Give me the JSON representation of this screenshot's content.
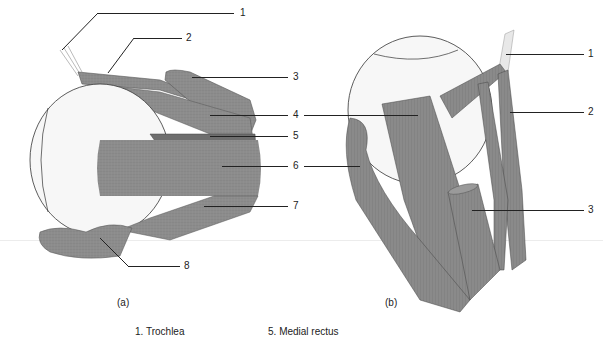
{
  "figure": {
    "panels": [
      {
        "id": "a",
        "caption": "(a)",
        "callouts": [
          "1",
          "2",
          "3",
          "4",
          "5",
          "6",
          "7",
          "8"
        ]
      },
      {
        "id": "b",
        "caption": "(b)",
        "callouts": [
          "1",
          "2",
          "3",
          "4",
          "6"
        ]
      }
    ],
    "legend": [
      {
        "number": "1.",
        "name": "Trochlea"
      },
      {
        "number": "5.",
        "name": "Medial rectus"
      }
    ],
    "colors": {
      "muscle": "#8a8a8a",
      "muscle_dark": "#6e6e6e",
      "eyeball": "#f7f7f7",
      "outline": "#333333"
    }
  }
}
